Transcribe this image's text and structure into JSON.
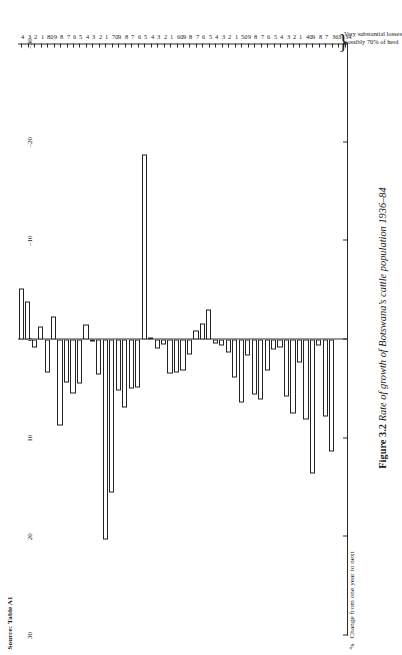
{
  "source": "Source: Table A1",
  "axis_title": {
    "symbol": "%",
    "text": "Change from one year to next"
  },
  "caption": {
    "figure_number": "Figure 3.2",
    "text": "Rate of growth of Botswana’s cattle population 1936–84"
  },
  "annotation": {
    "line1": "Very substantial losses",
    "line2": "possibly 70% of herd",
    "brace": "}"
  },
  "chart_data": {
    "type": "bar",
    "orientation": "horizontal-rotated",
    "title": "Figure 3.2 Rate of growth of Botswana’s cattle population 1936–84",
    "xlabel": "",
    "ylabel": "% Change from one year to next",
    "ylim": [
      -30,
      30
    ],
    "yticks": [
      30,
      20,
      10,
      0,
      -10,
      -20,
      -30
    ],
    "ytick_labels": [
      "30",
      "20",
      "10",
      "0",
      "–10",
      "–20",
      "–30"
    ],
    "grid": false,
    "legend": null,
    "axis_tick_labels": [
      "34",
      "35",
      "36",
      "7",
      "8",
      "9",
      "40",
      "1",
      "2",
      "3",
      "4",
      "5",
      "6",
      "7",
      "8",
      "9",
      "50",
      "1",
      "2",
      "3",
      "4",
      "5",
      "6",
      "7",
      "8",
      "9",
      "60",
      "1",
      "2",
      "3",
      "4",
      "5",
      "6",
      "7",
      "8",
      "9",
      "70",
      "1",
      "2",
      "3",
      "4",
      "5",
      "6",
      "7",
      "8",
      "9",
      "80",
      "1",
      "2",
      "3",
      "4"
    ],
    "categories": [
      "1934",
      "1935",
      "1936",
      "1937",
      "1938",
      "1939",
      "1940",
      "1941",
      "1942",
      "1943",
      "1944",
      "1945",
      "1946",
      "1947",
      "1948",
      "1949",
      "1950",
      "1951",
      "1952",
      "1953",
      "1954",
      "1955",
      "1956",
      "1957",
      "1958",
      "1959",
      "1960",
      "1961",
      "1962",
      "1963",
      "1964",
      "1965",
      "1966",
      "1967",
      "1968",
      "1969",
      "1970",
      "1971",
      "1972",
      "1973",
      "1974",
      "1975",
      "1976",
      "1977",
      "1978",
      "1979",
      "1980",
      "1981",
      "1982",
      "1983",
      "1984"
    ],
    "values": [
      null,
      null,
      11.4,
      7.8,
      0.6,
      13.6,
      8.1,
      2.3,
      7.5,
      5.8,
      0.8,
      1.0,
      3.1,
      6.1,
      5.6,
      1.6,
      6.4,
      3.9,
      1.3,
      0.6,
      0.4,
      -3.0,
      -1.6,
      -0.9,
      1.5,
      3.1,
      3.3,
      3.4,
      0.5,
      0.9,
      -0.2,
      -18.8,
      4.9,
      5.0,
      6.9,
      5.2,
      15.5,
      20.3,
      3.5,
      0.2,
      -1.5,
      4.5,
      5.5,
      4.4,
      8.7,
      -2.3,
      3.3,
      -1.3,
      0.8,
      -3.9,
      -5.2
    ]
  }
}
